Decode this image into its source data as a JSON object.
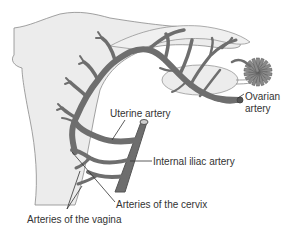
{
  "diagram": {
    "colors": {
      "background": "#ffffff",
      "tissue_fill": "#ececec",
      "tissue_outline": "#8a8a8a",
      "artery_fill": "#6e6e6e",
      "artery_outline": "#555555",
      "leader_line": "#333333",
      "label_text": "#333333"
    },
    "labels": {
      "uterine_artery": "Uterine artery",
      "ovarian_artery_line1": "Ovarian",
      "ovarian_artery_line2": "artery",
      "internal_iliac_artery": "Internal iliac artery",
      "arteries_cervix": "Arteries of the cervix",
      "arteries_vagina": "Arteries of the vagina"
    }
  }
}
